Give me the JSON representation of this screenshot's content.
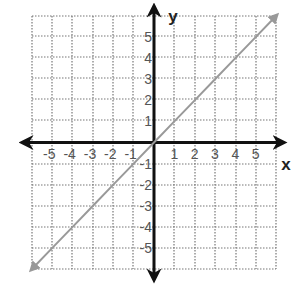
{
  "chart_data": {
    "type": "line",
    "title": "",
    "xlabel": "x",
    "ylabel": "y",
    "xlim": [
      -6,
      6
    ],
    "ylim": [
      -6,
      6
    ],
    "grid": true,
    "grid_style": "dotted",
    "x_ticks": [
      -5,
      -4,
      -3,
      -2,
      -1,
      1,
      2,
      3,
      4,
      5
    ],
    "y_ticks": [
      5,
      4,
      3,
      2,
      1,
      -1,
      -2,
      -3,
      -4,
      -5
    ],
    "x_tick_labels": [
      "-5",
      "-4",
      "-3",
      "-2",
      "-1",
      "1",
      "2",
      "3",
      "4",
      "5"
    ],
    "y_tick_labels": [
      "5",
      "4",
      "3",
      "2",
      "1",
      "-1",
      "-2",
      "-3",
      "-4",
      "-5"
    ],
    "series": [
      {
        "name": "y = x",
        "x": [
          -6,
          -5,
          -4,
          -3,
          -2,
          -1,
          0,
          1,
          2,
          3,
          4,
          5,
          6
        ],
        "y": [
          -6,
          -5,
          -4,
          -3,
          -2,
          -1,
          0,
          1,
          2,
          3,
          4,
          5,
          6
        ],
        "color": "#999999",
        "arrows": "both"
      }
    ],
    "legend": null
  },
  "colors": {
    "grid": "#777777",
    "axis": "#111111",
    "line": "#999999",
    "tick_text": "#555555"
  },
  "layout": {
    "x_px": [
      32,
      52,
      72,
      93,
      113,
      133,
      154,
      174,
      195,
      215,
      236,
      256,
      276
    ],
    "y_px": [
      269,
      248,
      227,
      206,
      185,
      164,
      143,
      120,
      99,
      78,
      57,
      36,
      16
    ]
  }
}
